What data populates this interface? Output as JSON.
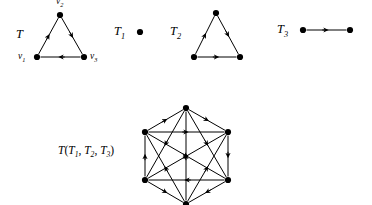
{
  "figure": {
    "type": "directed-graph-diagram",
    "background_color": "#ffffff",
    "ink_color": "#000000"
  },
  "labels": {
    "tournament_T": "T",
    "vertex_v1": "v",
    "vertex_v1_sub": "1",
    "vertex_v2": "v",
    "vertex_v2_sub": "2",
    "vertex_v3": "v",
    "vertex_v3_sub": "3",
    "tournament_T1": "T",
    "tournament_T1_sub": "1",
    "tournament_T2": "T",
    "tournament_T2_sub": "2",
    "tournament_T3": "T",
    "tournament_T3_sub": "3",
    "composition_prefix": "T",
    "composition_open": "(",
    "composition_a": "T",
    "composition_a_sub": "1",
    "composition_comma1": ",",
    "composition_b": "T",
    "composition_b_sub": "2",
    "composition_comma2": ",",
    "composition_c": "T",
    "composition_c_sub": "3",
    "composition_close": ")"
  },
  "graphs": {
    "T": {
      "name": "T",
      "vertices": [
        {
          "id": "v1",
          "x": 37,
          "y": 57,
          "label": "v1"
        },
        {
          "id": "v2",
          "x": 60,
          "y": 15,
          "label": "v2"
        },
        {
          "id": "v3",
          "x": 84,
          "y": 57,
          "label": "v3"
        }
      ],
      "arcs": [
        {
          "from": "v1",
          "to": "v2"
        },
        {
          "from": "v2",
          "to": "v3"
        },
        {
          "from": "v3",
          "to": "v1"
        }
      ]
    },
    "T1": {
      "name": "T1",
      "vertices": [
        {
          "id": "a1",
          "x": 140,
          "y": 32
        }
      ],
      "arcs": []
    },
    "T2": {
      "name": "T2",
      "vertices": [
        {
          "id": "b1",
          "x": 194,
          "y": 57
        },
        {
          "id": "b2",
          "x": 216,
          "y": 13
        },
        {
          "id": "b3",
          "x": 240,
          "y": 57
        }
      ],
      "arcs": [
        {
          "from": "b1",
          "to": "b2"
        },
        {
          "from": "b2",
          "to": "b3"
        },
        {
          "from": "b1",
          "to": "b3"
        }
      ]
    },
    "T3": {
      "name": "T3",
      "vertices": [
        {
          "id": "c1",
          "x": 303,
          "y": 30
        },
        {
          "id": "c2",
          "x": 350,
          "y": 30
        }
      ],
      "arcs": [
        {
          "from": "c1",
          "to": "c2"
        }
      ]
    },
    "composition": {
      "name": "T(T1, T2, T3)",
      "vertices": [
        {
          "id": "p1",
          "x": 186,
          "y": 108
        },
        {
          "id": "p2",
          "x": 145,
          "y": 132
        },
        {
          "id": "p3",
          "x": 228,
          "y": 132
        },
        {
          "id": "p4",
          "x": 145,
          "y": 180
        },
        {
          "id": "p5",
          "x": 228,
          "y": 180
        },
        {
          "id": "p6",
          "x": 186,
          "y": 204
        }
      ],
      "arcs": [
        {
          "from": "p2",
          "to": "p1"
        },
        {
          "from": "p1",
          "to": "p3"
        },
        {
          "from": "p2",
          "to": "p3"
        },
        {
          "from": "p4",
          "to": "p2"
        },
        {
          "from": "p1",
          "to": "p4"
        },
        {
          "from": "p1",
          "to": "p5"
        },
        {
          "from": "p3",
          "to": "p5"
        },
        {
          "from": "p5",
          "to": "p4"
        },
        {
          "from": "p6",
          "to": "p1"
        },
        {
          "from": "p6",
          "to": "p2"
        },
        {
          "from": "p6",
          "to": "p3"
        },
        {
          "from": "p4",
          "to": "p6"
        },
        {
          "from": "p5",
          "to": "p6"
        },
        {
          "from": "p2",
          "to": "p5"
        },
        {
          "from": "p4",
          "to": "p3"
        }
      ]
    }
  }
}
